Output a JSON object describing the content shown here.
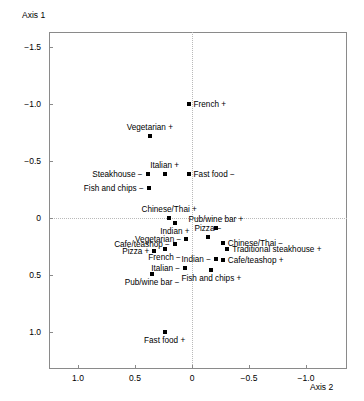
{
  "chart_data": {
    "type": "scatter",
    "title": "",
    "xlabel": "Axis 2",
    "ylabel": "Axis 1",
    "xlim": [
      1.25,
      -1.25
    ],
    "ylim": [
      -1.65,
      1.3
    ],
    "x_reversed": true,
    "y_reversed": true,
    "grid": false,
    "legend": "none",
    "reference_lines": {
      "x": 0,
      "y": 0,
      "style": "dotted"
    },
    "xticks": [
      {
        "value": 1.0,
        "label": "1.0"
      },
      {
        "value": 0.5,
        "label": "0.5"
      },
      {
        "value": 0.0,
        "label": "0"
      },
      {
        "value": -0.5,
        "label": "−0.5"
      },
      {
        "value": -1.0,
        "label": "−1.0"
      }
    ],
    "yticks": [
      {
        "value": -1.5,
        "label": "−1.5"
      },
      {
        "value": -1.0,
        "label": "−1.0"
      },
      {
        "value": -0.5,
        "label": "−0.5"
      },
      {
        "value": 0.0,
        "label": "0"
      },
      {
        "value": 0.5,
        "label": "0.5"
      },
      {
        "value": 1.0,
        "label": "1.0"
      }
    ],
    "points": [
      {
        "label": "French +",
        "x": 0.03,
        "y": -1.0,
        "pos": "r"
      },
      {
        "label": "Vegetarian +",
        "x": 0.37,
        "y": -0.72,
        "pos": "t"
      },
      {
        "label": "Italian +",
        "x": 0.24,
        "y": -0.39,
        "pos": "t"
      },
      {
        "label": "Steakhouse −",
        "x": 0.39,
        "y": -0.39,
        "pos": "l"
      },
      {
        "label": "Fast food −",
        "x": 0.03,
        "y": -0.39,
        "pos": "r"
      },
      {
        "label": "Fish and chips −",
        "x": 0.38,
        "y": -0.26,
        "pos": "l"
      },
      {
        "label": "Chinese/Thai +",
        "x": 0.2,
        "y": 0.0,
        "pos": "t"
      },
      {
        "label": "Indian +",
        "x": 0.15,
        "y": 0.04,
        "pos": "b"
      },
      {
        "label": "Pub/wine bar +",
        "x": -0.21,
        "y": 0.09,
        "pos": "t"
      },
      {
        "label": "Pizza −",
        "x": -0.14,
        "y": 0.17,
        "pos": "t"
      },
      {
        "label": "Vegetarian −",
        "x": 0.05,
        "y": 0.18,
        "pos": "l"
      },
      {
        "label": "Chinese/Thai −",
        "x": -0.27,
        "y": 0.22,
        "pos": "r"
      },
      {
        "label": "Cafe/teashop −",
        "x": 0.15,
        "y": 0.23,
        "pos": "l"
      },
      {
        "label": "Traditional steakhouse +",
        "x": -0.31,
        "y": 0.27,
        "pos": "r"
      },
      {
        "label": "Pizza +",
        "x": 0.33,
        "y": 0.29,
        "pos": "l"
      },
      {
        "label": "French −",
        "x": 0.24,
        "y": 0.27,
        "pos": "b"
      },
      {
        "label": "Indian −",
        "x": -0.21,
        "y": 0.36,
        "pos": "l"
      },
      {
        "label": "Cafe/teashop +",
        "x": -0.27,
        "y": 0.37,
        "pos": "r"
      },
      {
        "label": "Italian −",
        "x": 0.06,
        "y": 0.44,
        "pos": "l"
      },
      {
        "label": "Fish and chips +",
        "x": -0.17,
        "y": 0.46,
        "pos": "b"
      },
      {
        "label": "Pub/wine bar −",
        "x": 0.35,
        "y": 0.49,
        "pos": "b"
      },
      {
        "label": "Fast food +",
        "x": 0.24,
        "y": 1.0,
        "pos": "b"
      }
    ]
  }
}
